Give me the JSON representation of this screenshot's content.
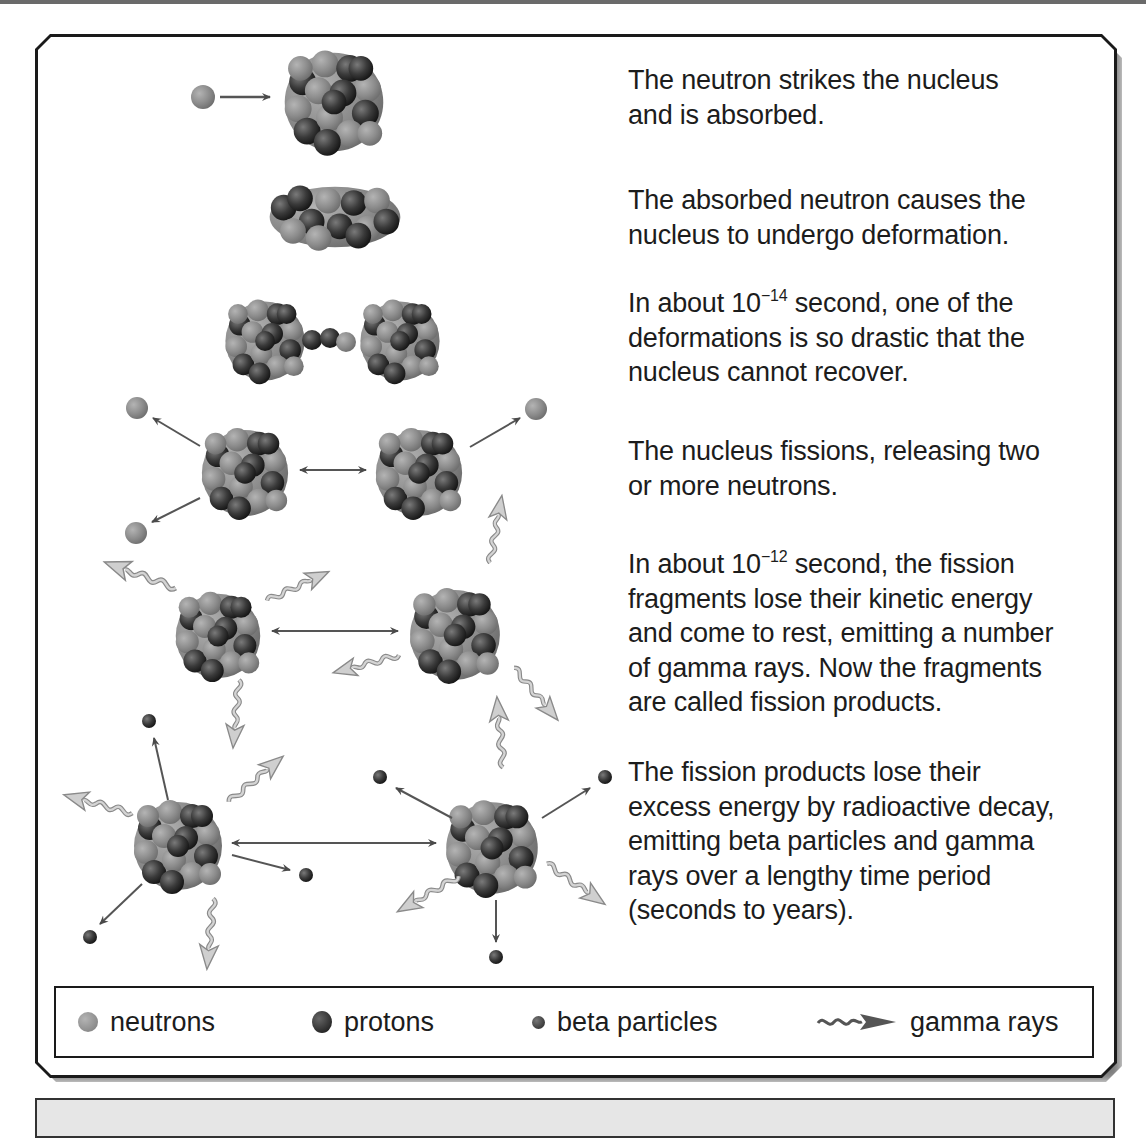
{
  "steps": [
    {
      "id": "absorb",
      "text": "The neutron strikes the nucleus and is absorbed.",
      "lines": [
        "The neutron strikes the nucleus",
        "and is absorbed."
      ]
    },
    {
      "id": "deform",
      "text": "The absorbed neutron causes the nucleus to undergo deformation.",
      "lines": [
        "The absorbed neutron causes the",
        "nucleus to undergo deformation."
      ]
    },
    {
      "id": "drastic",
      "text": "In about 10^-14 second, one of the deformations is so drastic that the nucleus cannot recover.",
      "line1_pre": "In about 10",
      "line1_exp": "−14",
      "line1_post": " second, one of the",
      "lines": [
        "deformations is so drastic that the",
        "nucleus cannot recover."
      ]
    },
    {
      "id": "fission",
      "text": "The nucleus fissions, releasing two or more neutrons.",
      "lines": [
        "The nucleus fissions, releasing two",
        "or more neutrons."
      ]
    },
    {
      "id": "gamma",
      "text": "In about 10^-12 second, the fission fragments lose their kinetic energy and come to rest, emitting a number of gamma rays. Now the fragments are called fission products.",
      "line1_pre": "In about 10",
      "line1_exp": "−12",
      "line1_post": " second, the fission",
      "lines": [
        "fragments lose their kinetic energy",
        "and come to rest, emitting a number",
        "of gamma rays. Now the fragments",
        "are called fission products."
      ]
    },
    {
      "id": "decay",
      "text": "The fission products lose their excess energy by radioactive decay, emitting beta particles and gamma rays over a lengthy time period (seconds to years).",
      "lines": [
        "The fission products lose their",
        "excess energy by radioactive decay,",
        "emitting beta particles and gamma",
        "rays over a lengthy time period",
        "(seconds to years)."
      ]
    }
  ],
  "legend": {
    "neutrons": "neutrons",
    "protons": "protons",
    "beta": "beta particles",
    "gamma": "gamma rays"
  },
  "colors": {
    "neutron": "#8c8c8c",
    "proton": "#3a3a3a",
    "beta": "#4a4a4a",
    "gamma_fill": "#c8c8c8",
    "arrow": "#555555",
    "border": "#1a1a1a",
    "bottom_box": "#e6e6e6"
  }
}
